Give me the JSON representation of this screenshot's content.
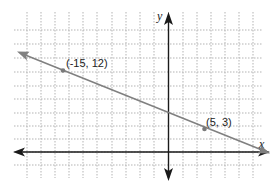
{
  "chart_data": {
    "type": "line",
    "title": "",
    "xlabel": "x",
    "ylabel": "y",
    "grid": true,
    "grid_style": "dotted",
    "line": {
      "slope": -0.45,
      "intercept": 5.25,
      "color": "#808080",
      "arrows": "both"
    },
    "points": [
      {
        "x": -15,
        "y": 12,
        "label": "(-15, 12)"
      },
      {
        "x": 5,
        "y": 3,
        "label": "(5, 3)"
      }
    ],
    "axis_color": "#1a1a1a",
    "grid_color": "#b0b0b0"
  },
  "labels": {
    "x_axis": "x",
    "y_axis": "y",
    "point1": "(-15, 12)",
    "point2": "(5, 3)"
  }
}
